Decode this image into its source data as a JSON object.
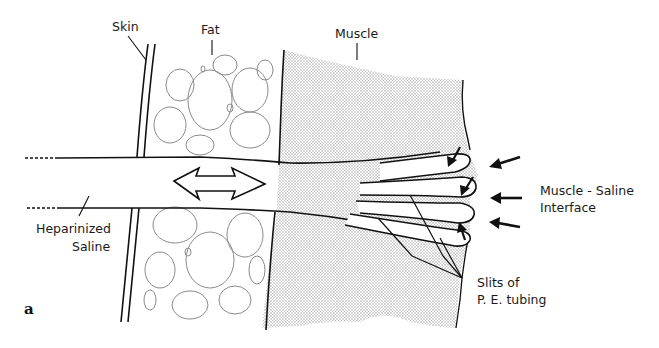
{
  "figure": {
    "panel_letter": "a",
    "labels": {
      "skin": "Skin",
      "fat": "Fat",
      "muscle": "Muscle",
      "heparinized_saline": [
        "Heparinized",
        "Saline"
      ],
      "muscle_saline_interface": [
        "Muscle - Saline",
        "Interface"
      ],
      "slits": [
        "Slits of",
        "P. E. tubing"
      ]
    },
    "colors": {
      "ink": "#111111",
      "fat_bubbles": "#8a8a8a",
      "muscle_stipple": "#9a9a9a",
      "background": "#ffffff"
    }
  }
}
